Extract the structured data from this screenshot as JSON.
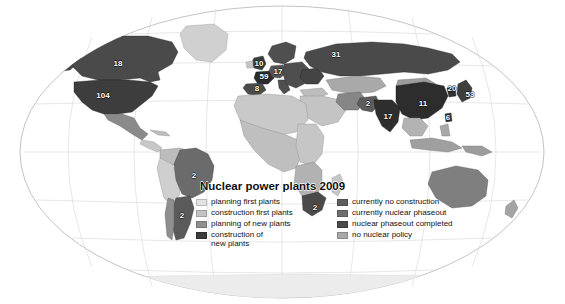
{
  "figure": {
    "title": "Nuclear power plants 2009",
    "title_line1": "Nuclear power",
    "title_line2": "plants 2009",
    "projection": "elliptical-world",
    "background_color": "#ffffff",
    "graticule_color": "#b9b9b9",
    "ocean_color": "#ffffff"
  },
  "legend": {
    "left_column": [
      {
        "label": "planning first plants",
        "color": "#e2e2e2"
      },
      {
        "label": "construction first plants",
        "color": "#c3c3c3"
      },
      {
        "label": "planning of new plants",
        "color": "#8f8f8f"
      },
      {
        "label": "construction of\nnew plants",
        "color": "#3a3a3a"
      }
    ],
    "right_column": [
      {
        "label": "currently no construction",
        "color": "#5d5d5d"
      },
      {
        "label": "currently nuclear phaseout",
        "color": "#6e6e6e"
      },
      {
        "label": "nuclear phaseout completed",
        "color": "#4a4a4a"
      },
      {
        "label": "no nuclear policy",
        "color": "#a8a8a8"
      }
    ]
  },
  "map_labels": [
    {
      "name": "canada",
      "value": "18",
      "x": 118,
      "y": 64,
      "tone": "dark"
    },
    {
      "name": "united-states",
      "value": "104",
      "x": 103,
      "y": 96,
      "tone": "dark"
    },
    {
      "name": "united-kingdom",
      "value": "10",
      "x": 259,
      "y": 64,
      "tone": "dark"
    },
    {
      "name": "germany",
      "value": "17",
      "x": 278,
      "y": 72,
      "tone": "dark"
    },
    {
      "name": "france",
      "value": "59",
      "x": 264,
      "y": 77,
      "tone": "dark"
    },
    {
      "name": "spain",
      "value": "8",
      "x": 257,
      "y": 89,
      "tone": "dark"
    },
    {
      "name": "russia",
      "value": "31",
      "x": 336,
      "y": 55,
      "tone": "dark"
    },
    {
      "name": "pakistan",
      "value": "2",
      "x": 368,
      "y": 104,
      "tone": "dark"
    },
    {
      "name": "india",
      "value": "17",
      "x": 388,
      "y": 117,
      "tone": "dark"
    },
    {
      "name": "china",
      "value": "11",
      "x": 423,
      "y": 104,
      "tone": "dark"
    },
    {
      "name": "south-korea",
      "value": "20",
      "x": 452,
      "y": 89,
      "tone": "dark"
    },
    {
      "name": "japan",
      "value": "53",
      "x": 470,
      "y": 95,
      "tone": "dark"
    },
    {
      "name": "taiwan",
      "value": "6",
      "x": 448,
      "y": 118,
      "tone": "dark"
    },
    {
      "name": "brazil",
      "value": "2",
      "x": 194,
      "y": 176,
      "tone": "dark"
    },
    {
      "name": "argentina",
      "value": "2",
      "x": 182,
      "y": 216,
      "tone": "dark"
    },
    {
      "name": "south-africa",
      "value": "2",
      "x": 315,
      "y": 208,
      "tone": "dark"
    }
  ],
  "chart_data": {
    "type": "map",
    "title": "Nuclear power plants 2009",
    "value_label": "number of nuclear power plants",
    "categories": [
      "Canada",
      "United States",
      "United Kingdom",
      "Germany",
      "France",
      "Spain",
      "Russia",
      "Pakistan",
      "India",
      "China",
      "South Korea",
      "Japan",
      "Taiwan",
      "Brazil",
      "Argentina",
      "South Africa"
    ],
    "values": [
      18,
      104,
      10,
      17,
      59,
      8,
      31,
      2,
      17,
      11,
      20,
      53,
      6,
      2,
      2,
      2
    ],
    "legend_position": "inset-bottom-left",
    "classes": [
      "planning first plants",
      "construction first plants",
      "planning of new plants",
      "construction of new plants",
      "currently no construction",
      "currently nuclear phaseout",
      "nuclear phaseout completed",
      "no nuclear policy"
    ]
  }
}
